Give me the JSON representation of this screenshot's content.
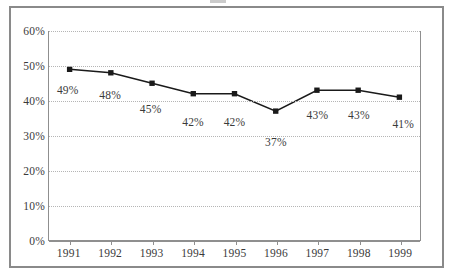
{
  "chart_data": {
    "type": "line",
    "title": "",
    "subtitle": "",
    "xlabel": "",
    "ylabel": "",
    "categories": [
      "1991",
      "1992",
      "1993",
      "1994",
      "1995",
      "1996",
      "1997",
      "1998",
      "1999"
    ],
    "values": [
      49,
      48,
      45,
      42,
      42,
      37,
      43,
      43,
      41
    ],
    "point_labels": [
      "49%",
      "48%",
      "45%",
      "42%",
      "42%",
      "37%",
      "43%",
      "43%",
      "41%"
    ],
    "ylim": [
      0,
      60
    ],
    "ytick_values": [
      0,
      10,
      20,
      30,
      40,
      50,
      60
    ],
    "ytick_labels": [
      "0%",
      "10%",
      "20%",
      "30%",
      "40%",
      "50%",
      "60%"
    ],
    "grid": true,
    "legend": "none",
    "series": [
      {
        "name": "",
        "values": [
          49,
          48,
          45,
          42,
          42,
          37,
          43,
          43,
          41
        ],
        "marker": "square",
        "marker_color": "#1a1a1a",
        "line_color": "#1a1a1a"
      }
    ],
    "colors": {
      "line": "#1a1a1a",
      "marker": "#1a1a1a",
      "gridline": "#b5b5b5",
      "axis": "#8f8f8f",
      "frame": "#8a8a8a",
      "text": "#3a3a3a",
      "background": "#ffffff"
    }
  }
}
